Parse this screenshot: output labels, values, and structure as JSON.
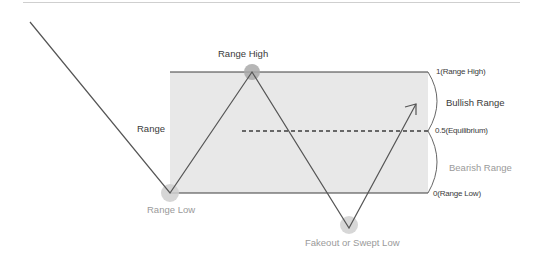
{
  "diagram": {
    "colors": {
      "line": "#555555",
      "range_fill": "#e8e8e8",
      "range_border": "#3c3c3c",
      "point_marker": "#c8c8c8",
      "point_marker_high": "#a9a9a9",
      "divider": "#cfcfcf"
    },
    "labels": {
      "range": "Range",
      "range_high": "Range High",
      "range_low": "Range Low",
      "swept_low": "Fakeout or Swept Low",
      "level_high": "1(Range High)",
      "level_mid": "0.5(Equilibrium)",
      "level_low": "0(Range Low)",
      "bullish_range": "Bullish Range",
      "bearish_range": "Bearish Range"
    },
    "levels": [
      {
        "value": 1,
        "name": "Range High"
      },
      {
        "value": 0.5,
        "name": "Equilibrium"
      },
      {
        "value": 0,
        "name": "Range Low"
      }
    ],
    "price_path": [
      {
        "point": "start",
        "x": 30,
        "y": 22
      },
      {
        "point": "Range Low",
        "x": 170,
        "y": 193
      },
      {
        "point": "Range High",
        "x": 252,
        "y": 72
      },
      {
        "point": "Fakeout or Swept Low",
        "x": 349,
        "y": 228
      },
      {
        "point": "arrow-tip",
        "x": 416,
        "y": 104
      }
    ]
  }
}
